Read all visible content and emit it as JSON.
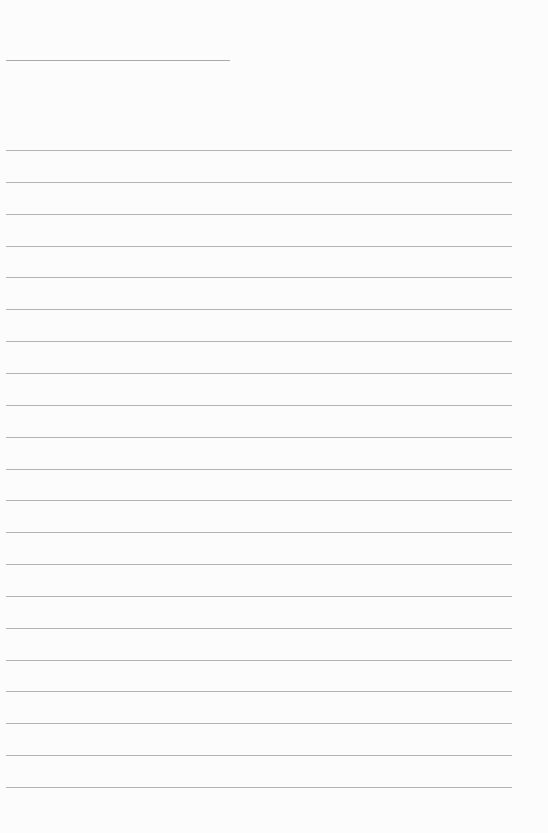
{
  "document": {
    "type": "blank-lined-paper",
    "header_line": {
      "x": 6,
      "y": 60,
      "width": 224
    },
    "ruled_lines": {
      "count": 21,
      "x": 6,
      "width": 506,
      "first_y": 150,
      "spacing": 31.85
    },
    "colors": {
      "paper": "#fcfcfc",
      "line": "#b3b3b3"
    }
  }
}
